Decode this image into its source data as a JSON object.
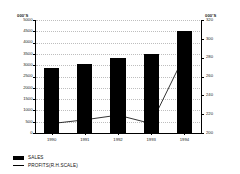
{
  "chart_data": {
    "type": "bar",
    "title": "",
    "xlabel": "",
    "ylabel": "000'S",
    "y2label": "000'S",
    "categories": [
      "1990",
      "1991",
      "1992",
      "1993",
      "1994"
    ],
    "series": [
      {
        "name": "SALES",
        "type": "bar",
        "axis": "left",
        "color": "#000000",
        "values": [
          2880,
          3060,
          3330,
          3500,
          4500
        ]
      },
      {
        "name": "PROFITS(R.H.SCALE)",
        "type": "line",
        "axis": "right",
        "color": "#000000",
        "values": [
          210,
          214,
          219,
          210,
          282
        ]
      }
    ],
    "ylim": [
      0,
      5000
    ],
    "yticks": [
      5000,
      4500,
      4000,
      3500,
      3000,
      2500,
      2000,
      1500,
      1000,
      500,
      0
    ],
    "y2lim": [
      200,
      320
    ],
    "y2ticks": [
      320,
      300,
      280,
      260,
      240,
      220,
      200
    ],
    "grid": "dotted-ticks",
    "legend_position": "bottom-left"
  },
  "axes": {
    "left_unit": "000'S",
    "right_unit": "000'S",
    "left_ticks": [
      "5000",
      "4500",
      "4000",
      "3500",
      "3000",
      "2500",
      "2000",
      "1500",
      "1000",
      "500",
      "0"
    ],
    "right_ticks": [
      "320",
      "300",
      "280",
      "260",
      "240",
      "220",
      "200"
    ],
    "x_ticks": [
      "1990",
      "1991",
      "1992",
      "1993",
      "1994"
    ]
  },
  "legend": {
    "items": [
      {
        "label": "SALES",
        "marker": "filled-rect"
      },
      {
        "label": "PROFITS(R.H.SCALE)",
        "marker": "line"
      }
    ]
  }
}
